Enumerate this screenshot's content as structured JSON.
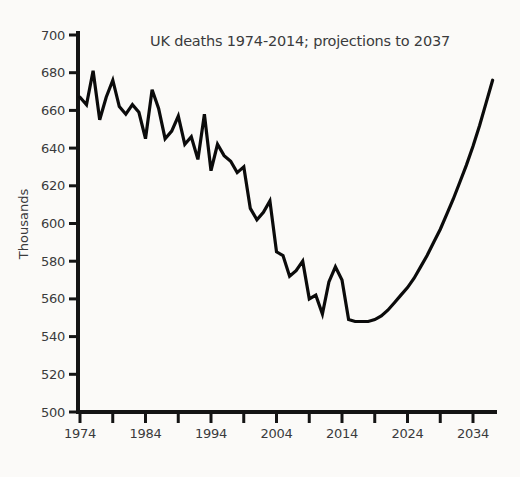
{
  "page": {
    "background": "#fbfaf8"
  },
  "chart_data": {
    "type": "line",
    "title": "UK deaths 1974-2014; projections to 2037",
    "xlabel": "",
    "ylabel": "Thousands",
    "xlim": [
      1974,
      2038
    ],
    "ylim": [
      500,
      700
    ],
    "grid": false,
    "legend": false,
    "line_color": "#0b0b0b",
    "axis_color": "#141414",
    "label_color": "#3a3a3c",
    "y_ticks": [
      500,
      520,
      540,
      560,
      580,
      600,
      620,
      640,
      660,
      680,
      700
    ],
    "x_minor_ticks": [
      1974,
      1979,
      1984,
      1989,
      1994,
      1999,
      2004,
      2009,
      2014,
      2019,
      2024,
      2029,
      2034
    ],
    "x_tick_labels": [
      "1974",
      "1984",
      "1994",
      "2004",
      "2014",
      "2024",
      "2034"
    ],
    "actual_through_year": 2014,
    "projection_end_year": 2037,
    "series": [
      {
        "name": "UK deaths, thousands (actual 1974-2014, projected 2015-2037)",
        "x_start": 1974,
        "x_step": 1,
        "values": [
          667,
          663,
          681,
          655,
          667,
          676,
          662,
          658,
          663,
          659,
          645,
          671,
          661,
          645,
          649,
          657,
          642,
          646,
          634,
          658,
          628,
          642,
          636,
          633,
          627,
          630,
          608,
          602,
          606,
          612,
          585,
          583,
          572,
          575,
          580,
          560,
          562,
          552,
          569,
          577,
          570,
          549,
          548,
          548,
          548,
          549,
          551,
          554,
          558,
          562,
          566,
          571,
          577,
          583,
          590,
          597,
          605,
          613,
          622,
          631,
          641,
          652,
          664,
          676
        ]
      }
    ]
  }
}
